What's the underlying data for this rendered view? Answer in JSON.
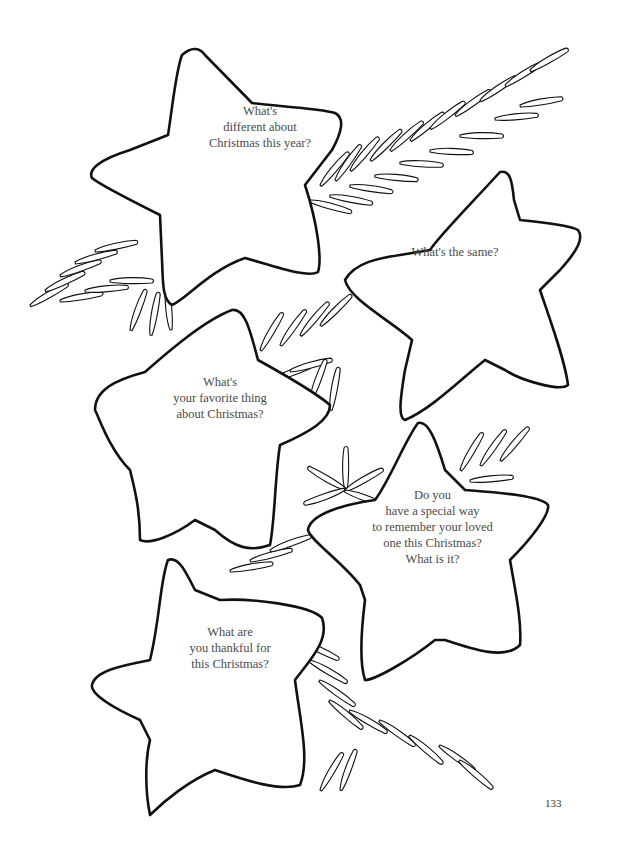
{
  "page": {
    "number": "133",
    "background": "#ffffff",
    "line_color": "#111111",
    "text_color": "#4a4a4a"
  },
  "stars": [
    {
      "id": "star-1",
      "lines": [
        "What's",
        "different about",
        "Christmas this year?"
      ]
    },
    {
      "id": "star-2",
      "lines": [
        "What's the same?"
      ]
    },
    {
      "id": "star-3",
      "lines": [
        "What's",
        "your favorite thing",
        "about Christmas?"
      ]
    },
    {
      "id": "star-4",
      "lines": [
        "Do you",
        "have a special way",
        "to remember your loved",
        "one this Christmas?",
        "What is it?"
      ]
    },
    {
      "id": "star-5",
      "lines": [
        "What are",
        "you thankful for",
        "this Christmas?"
      ]
    }
  ],
  "decorations": [
    "pine-branch",
    "pine-branch",
    "pine-branch",
    "pine-branch"
  ]
}
